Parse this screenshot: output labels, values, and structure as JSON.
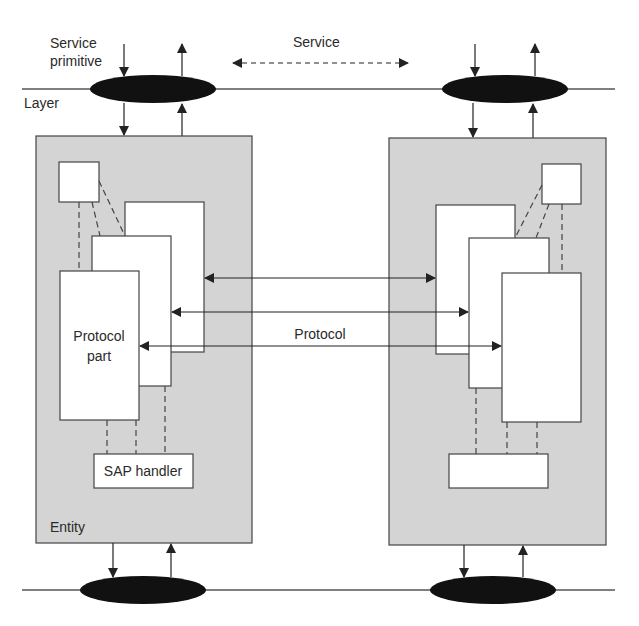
{
  "diagram": {
    "labels": {
      "service_primitive_line1": "Service",
      "service_primitive_line2": "primitive",
      "service": "Service",
      "layer": "Layer",
      "protocol": "Protocol",
      "protocol_part_line1": "Protocol",
      "protocol_part_line2": "part",
      "sap_handler": "SAP handler",
      "entity": "Entity"
    },
    "colors": {
      "entity_fill": "#d4d4d4",
      "box_fill": "#ffffff",
      "stroke": "#3a3a3a",
      "sap_ellipse": "#111111"
    },
    "nodes": [
      {
        "id": "top-left-sap",
        "type": "ellipse"
      },
      {
        "id": "top-right-sap",
        "type": "ellipse"
      },
      {
        "id": "bottom-left-sap",
        "type": "ellipse"
      },
      {
        "id": "bottom-right-sap",
        "type": "ellipse"
      },
      {
        "id": "left-entity",
        "label": "Entity"
      },
      {
        "id": "right-entity"
      },
      {
        "id": "left-protocol-part-front",
        "label": "Protocol part"
      },
      {
        "id": "left-sap-handler",
        "label": "SAP handler"
      },
      {
        "id": "right-sap-handler",
        "label": ""
      }
    ],
    "edges": [
      {
        "from": "left-protocol-part-back",
        "to": "right-protocol-part-back",
        "style": "bidirectional"
      },
      {
        "from": "left-protocol-part-middle",
        "to": "right-protocol-part-middle",
        "style": "bidirectional"
      },
      {
        "from": "left-protocol-part-front",
        "to": "right-protocol-part-front",
        "style": "bidirectional",
        "label": "Protocol"
      },
      {
        "from": "top-left-sap",
        "to": "top-right-sap",
        "style": "dashed-bidirectional",
        "label": "Service"
      }
    ]
  }
}
